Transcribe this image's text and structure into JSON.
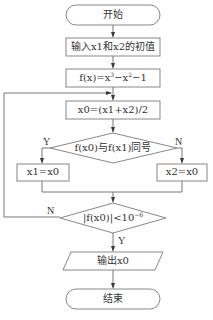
{
  "flowchart": {
    "start": {
      "label": "开始"
    },
    "input": {
      "label": "输入x1和x2的初值"
    },
    "function_def": {
      "base": "f(x)=x",
      "exp1": "3",
      "mid": "−x",
      "exp2": "2",
      "tail": "−1"
    },
    "midpoint": {
      "label": "x0=(x1+x2)/2"
    },
    "decision_sign": {
      "label": "f(x0)与f(x1)同号",
      "yes_label": "Y",
      "no_label": "N"
    },
    "assign_x1": {
      "label": "x1=x0"
    },
    "assign_x2": {
      "label": "x2=x0"
    },
    "decision_tolerance": {
      "base": "|f(x0)|<10",
      "exp": "−6",
      "yes_label": "Y",
      "no_label": "N"
    },
    "output": {
      "label": "输出x0"
    },
    "end": {
      "label": "结束"
    }
  },
  "colors": {
    "stroke": "#7a7a7a",
    "text": "#333333",
    "background": "#ffffff"
  }
}
